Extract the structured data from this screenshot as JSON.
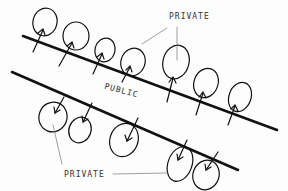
{
  "diagram": {
    "labels": {
      "top_private": "PRIVATE",
      "public": "PUBLIC",
      "bottom_private": "PRIVATE"
    },
    "colors": {
      "ink": "#111111",
      "leader": "#777777",
      "background": "#fdfdfd"
    },
    "upper_line": {
      "x1": 23,
      "y1": 36,
      "x2": 277,
      "y2": 130
    },
    "lower_line": {
      "x1": 12,
      "y1": 72,
      "x2": 238,
      "y2": 170
    },
    "upper_lots": [
      {
        "cx": 45,
        "cy": 22,
        "rx": 12,
        "ry": 14
      },
      {
        "cx": 76,
        "cy": 36,
        "rx": 13,
        "ry": 14
      },
      {
        "cx": 105,
        "cy": 50,
        "rx": 10,
        "ry": 12
      },
      {
        "cx": 133,
        "cy": 62,
        "rx": 12,
        "ry": 14
      },
      {
        "cx": 176,
        "cy": 62,
        "rx": 13,
        "ry": 17
      },
      {
        "cx": 206,
        "cy": 83,
        "rx": 12,
        "ry": 15
      },
      {
        "cx": 240,
        "cy": 97,
        "rx": 11,
        "ry": 15
      }
    ],
    "lower_lots": [
      {
        "cx": 53,
        "cy": 117,
        "rx": 14,
        "ry": 15
      },
      {
        "cx": 80,
        "cy": 130,
        "rx": 11,
        "ry": 13
      },
      {
        "cx": 124,
        "cy": 140,
        "rx": 14,
        "ry": 17
      },
      {
        "cx": 180,
        "cy": 164,
        "rx": 12,
        "ry": 18
      },
      {
        "cx": 206,
        "cy": 175,
        "rx": 13,
        "ry": 15
      }
    ]
  }
}
